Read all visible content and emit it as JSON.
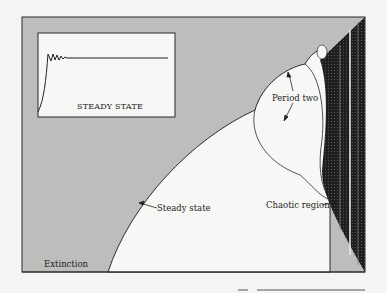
{
  "diagram": {
    "colors": {
      "paper": "#f4f4f2",
      "extinction_fill": "#bdbdbb",
      "stable_fill": "#f7f7f5",
      "chaotic_fill": "#1e1e1e",
      "line": "#2a2a2a"
    },
    "regions": [
      {
        "id": "extinction",
        "label": "Extinction"
      },
      {
        "id": "steady",
        "label": "Steady state"
      },
      {
        "id": "period-two",
        "label": "Period two"
      },
      {
        "id": "chaotic",
        "label": "Chaotic region"
      }
    ],
    "inset": {
      "title": "STEADY STATE",
      "description": "Damped oscillation settling to a constant level"
    }
  }
}
